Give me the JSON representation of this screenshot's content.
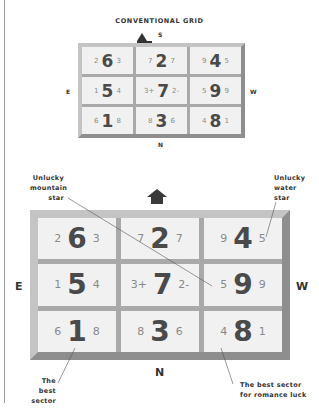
{
  "small_grid": {
    "title": "CONVENTIONAL GRID",
    "directions": {
      "top": "S",
      "bottom": "N",
      "left": "E",
      "right": "W"
    },
    "cells": [
      {
        "left": "2",
        "center": "6",
        "right": "3"
      },
      {
        "left": "7",
        "center": "2",
        "right": "7"
      },
      {
        "left": "9",
        "center": "4",
        "right": "5"
      },
      {
        "left": "1",
        "center": "5",
        "right": "4"
      },
      {
        "left": "3+",
        "center": "7",
        "right": "2-"
      },
      {
        "left": "5",
        "center": "9",
        "right": "9"
      },
      {
        "left": "6",
        "center": "1",
        "right": "8"
      },
      {
        "left": "8",
        "center": "3",
        "right": "6"
      },
      {
        "left": "4",
        "center": "8",
        "right": "1"
      }
    ]
  },
  "large_grid": {
    "directions": {
      "bottom": "N",
      "left": "E",
      "right": "W"
    },
    "cells": [
      {
        "left": "2",
        "center": "6",
        "right": "3"
      },
      {
        "left": "7",
        "center": "2",
        "right": "7"
      },
      {
        "left": "9",
        "center": "4",
        "right": "5"
      },
      {
        "left": "1",
        "center": "5",
        "right": "4"
      },
      {
        "left": "3+",
        "center": "7",
        "right": "2-"
      },
      {
        "left": "5",
        "center": "9",
        "right": "9"
      },
      {
        "left": "6",
        "center": "1",
        "right": "8"
      },
      {
        "left": "8",
        "center": "3",
        "right": "6"
      },
      {
        "left": "4",
        "center": "8",
        "right": "1"
      }
    ]
  },
  "annotations": {
    "mountain": [
      "Unlucky",
      "mountain",
      "star"
    ],
    "water": [
      "Unlucky",
      "water",
      "star"
    ],
    "best": [
      "The best",
      "sector"
    ],
    "romance": [
      "The best sector",
      "for romance luck"
    ]
  },
  "icons": {
    "facing_marker": "triangle-marker",
    "facing_arrow": "up-arrow"
  }
}
